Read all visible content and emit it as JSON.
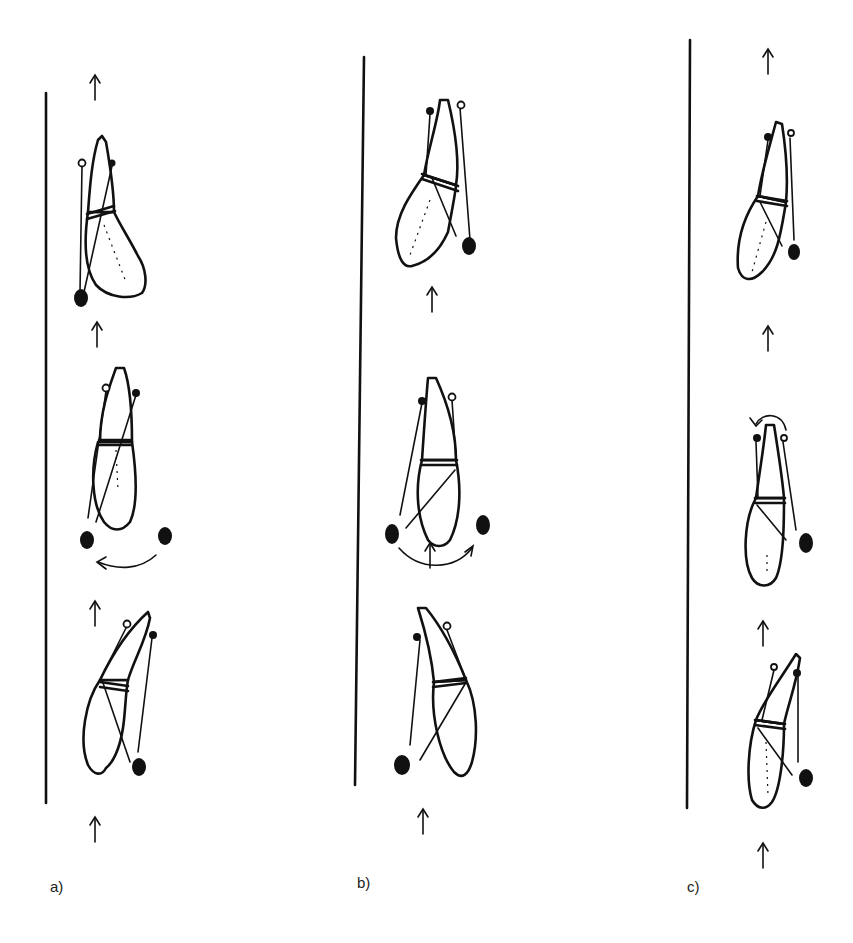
{
  "figure": {
    "colors": {
      "ink": "#111111",
      "background": "#ffffff"
    },
    "panels": [
      {
        "id": "a",
        "label": "a)",
        "frames": [
          {
            "position": "top",
            "description": "horse bent, hindquarters to right, ball at left-rear"
          },
          {
            "position": "middle",
            "description": "horse straight, ball moved from right to left (curved arrow)"
          },
          {
            "position": "bottom",
            "description": "horse bent, ball at right-rear"
          }
        ]
      },
      {
        "id": "b",
        "label": "b)",
        "frames": [
          {
            "position": "top",
            "description": "horse bent, hindquarters to left, ball at right-rear"
          },
          {
            "position": "middle",
            "description": "horse straight, ball moved from left to right (curved arrow)"
          },
          {
            "position": "bottom",
            "description": "horse bent, ball at left-rear"
          }
        ]
      },
      {
        "id": "c",
        "label": "c)",
        "frames": [
          {
            "position": "top",
            "description": "horse bent, ball at right-rear"
          },
          {
            "position": "middle",
            "description": "horse straight, rotation arrow at head"
          },
          {
            "position": "bottom",
            "description": "horse bent, ball at right-rear"
          }
        ]
      }
    ],
    "direction_arrow": "up-arrow"
  }
}
